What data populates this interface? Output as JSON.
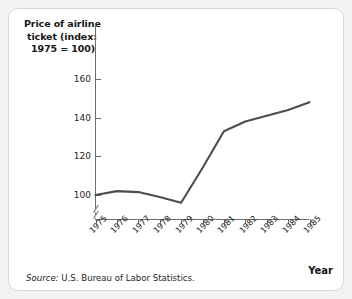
{
  "figure": {
    "title_lines": [
      "Price of airline",
      "ticket (index:",
      "1975 = 100)"
    ],
    "year_axis_label": "Year",
    "source_prefix": "Source:",
    "source_text": "U.S. Bureau of Labor Statistics."
  },
  "chart_data": {
    "type": "line",
    "title": "Price of airline ticket (index: 1975 = 100)",
    "xlabel": "Year",
    "ylabel": "Price of airline ticket (index: 1975 = 100)",
    "categories": [
      "1975",
      "1976",
      "1977",
      "1978",
      "1979",
      "1980",
      "1981",
      "1982",
      "1983",
      "1984",
      "1985"
    ],
    "x": [
      1975,
      1976,
      1977,
      1978,
      1979,
      1980,
      1981,
      1982,
      1983,
      1984,
      1985
    ],
    "values": [
      100,
      102,
      101.5,
      99,
      96,
      114,
      133,
      138,
      141,
      144,
      148
    ],
    "series": [
      {
        "name": "Price of airline ticket (index: 1975 = 100)",
        "values": [
          100,
          102,
          101.5,
          99,
          96,
          114,
          133,
          138,
          141,
          144,
          148
        ]
      }
    ],
    "ytick_labels": [
      "100",
      "120",
      "140",
      "160"
    ],
    "yticks": [
      100,
      120,
      140,
      160
    ],
    "ylim": [
      92,
      164
    ],
    "xlim": [
      1975,
      1985
    ],
    "axis_break": true,
    "grid": false,
    "legend": "none",
    "line_color": "#4d4d4d"
  }
}
